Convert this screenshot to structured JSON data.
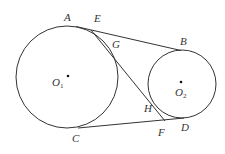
{
  "diagram": {
    "type": "geometry",
    "colors": {
      "stroke": "#333333",
      "background": "#ffffff"
    },
    "circles": [
      {
        "name": "O1",
        "cx": 67,
        "cy": 77,
        "r": 51
      },
      {
        "name": "O2",
        "cx": 182,
        "cy": 84,
        "r": 34
      }
    ],
    "points": {
      "A": {
        "label": "A",
        "x": 76,
        "y": 26
      },
      "B": {
        "label": "B",
        "x": 180,
        "y": 50
      },
      "C": {
        "label": "C",
        "x": 80,
        "y": 128
      },
      "D": {
        "label": "D",
        "x": 183,
        "y": 118
      },
      "E": {
        "label": "E",
        "x": 92,
        "y": 30
      },
      "F": {
        "label": "F",
        "x": 163,
        "y": 120
      },
      "G": {
        "label": "G",
        "x": 107,
        "y": 45
      },
      "H": {
        "label": "H",
        "x": 154,
        "y": 103
      }
    },
    "labels": {
      "A": "A",
      "B": "B",
      "C": "C",
      "D": "D",
      "E": "E",
      "F": "F",
      "G": "G",
      "H": "H",
      "O1_main": "O",
      "O1_sub": "1",
      "O2_main": "O",
      "O2_sub": "2"
    }
  }
}
